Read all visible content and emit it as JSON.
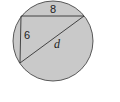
{
  "diagram": {
    "colors": {
      "fill": "#c9c9c9",
      "stroke": "#333333",
      "background": "#ffffff"
    },
    "labels": {
      "top_leg": "8",
      "left_leg": "6",
      "hypotenuse": "d"
    }
  }
}
